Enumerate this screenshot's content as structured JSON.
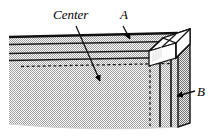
{
  "figure": {
    "background_color": "#ffffff"
  },
  "labels": {
    "center": "Center",
    "a": "A",
    "b": "B"
  },
  "colors": {
    "outline": "#000000",
    "fill_hatch": "#c8c8c8",
    "fill_hatch_dark": "#a8a8a8",
    "face_light": "#ffffff",
    "face_mid": "#d8d8d8",
    "leader": "#1a1a1a"
  },
  "annotations": [
    {
      "name": "center-leader",
      "label": "Center",
      "from": [
        76,
        26
      ],
      "to": [
        101,
        83
      ],
      "arrowhead": "to"
    },
    {
      "name": "a-leader",
      "label": "A",
      "from": [
        122,
        26
      ],
      "to": [
        130,
        41
      ],
      "arrowhead": "to"
    },
    {
      "name": "b-leader",
      "label": "B",
      "from": [
        196,
        91
      ],
      "to": [
        176,
        96
      ],
      "arrowhead": "to"
    }
  ],
  "geometry": {
    "plate_top_edge_y": 36,
    "plate_bottom_edge_y": 128,
    "plate_left_x": 9,
    "plate_right_x": 190,
    "horizontal_rules_y": [
      44,
      53,
      60
    ],
    "dashed_rule_y": 66,
    "vertical_rules_x": [
      158,
      170
    ],
    "dashed_vertical_x": 150,
    "corner_box_top_y": 33
  }
}
